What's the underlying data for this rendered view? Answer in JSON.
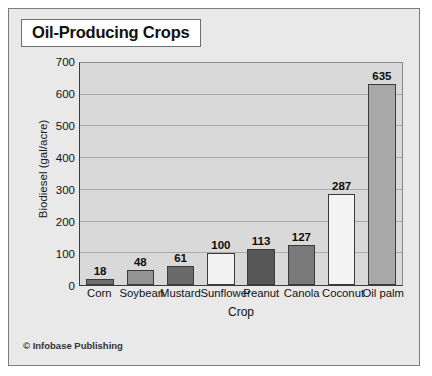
{
  "figure": {
    "title": "Oil-Producing Crops",
    "credit": "© Infobase Publishing"
  },
  "chart_data": {
    "type": "bar",
    "title": "Oil-Producing Crops",
    "xlabel": "Crop",
    "ylabel": "Biodiesel (gal/acre)",
    "ylim": [
      0,
      700
    ],
    "yticks": [
      0,
      100,
      200,
      300,
      400,
      500,
      600,
      700
    ],
    "grid": "horizontal",
    "legend": "none",
    "categories": [
      "Corn",
      "Soybean",
      "Mustard",
      "Sunflower",
      "Peanut",
      "Canola",
      "Coconut",
      "Oil palm"
    ],
    "values": [
      18,
      48,
      61,
      100,
      113,
      127,
      287,
      635
    ],
    "value_labels": [
      "18",
      "48",
      "61",
      "100",
      "113",
      "127",
      "287",
      "635"
    ],
    "bar_colors": [
      "#6e6e6e",
      "#949494",
      "#6a6a6a",
      "#f2f2f2",
      "#575757",
      "#797979",
      "#f4f4f4",
      "#a8a8a8"
    ],
    "bar_border_color": "#3a3a3a"
  },
  "colors": {
    "plot_background": "#d9d9d9",
    "figure_background": "#e9e9e9",
    "gridline": "#aaaaaa",
    "axis": "#3b3b3b",
    "text": "#111111"
  }
}
